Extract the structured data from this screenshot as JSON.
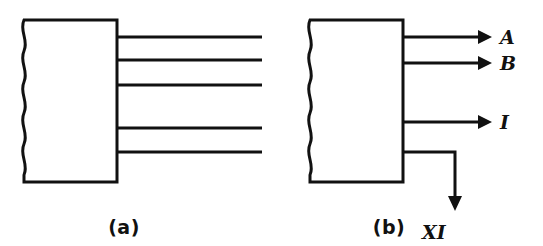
{
  "figure": {
    "background_color": "#ffffff",
    "line_color": "#111111",
    "panels": [
      {
        "id": "a",
        "caption": "(a)",
        "caption_x": 124,
        "caption_y": 234,
        "box": {
          "x": 22,
          "y": 20,
          "width": 95,
          "height": 162
        },
        "left_edge_style": "wavy-break",
        "lines": [
          {
            "name": "line-1",
            "y": 37,
            "x_start": 117,
            "x_end": 262,
            "arrow": false,
            "label": ""
          },
          {
            "name": "line-2",
            "y": 60,
            "x_start": 117,
            "x_end": 262,
            "arrow": false,
            "label": ""
          },
          {
            "name": "line-3",
            "y": 85,
            "x_start": 117,
            "x_end": 262,
            "arrow": false,
            "label": ""
          },
          {
            "name": "line-4",
            "y": 128,
            "x_start": 117,
            "x_end": 262,
            "arrow": false,
            "label": ""
          },
          {
            "name": "line-5",
            "y": 152,
            "x_start": 117,
            "x_end": 262,
            "arrow": false,
            "label": ""
          }
        ]
      },
      {
        "id": "b",
        "caption": "(b)",
        "caption_x": 389,
        "caption_y": 234,
        "box": {
          "x": 308,
          "y": 20,
          "width": 95,
          "height": 162
        },
        "left_edge_style": "wavy-break",
        "lines": [
          {
            "name": "line-a",
            "y": 37,
            "x_start": 403,
            "x_end": 487,
            "arrow": true,
            "label": "A",
            "label_x": 500,
            "label_y": 44
          },
          {
            "name": "line-b",
            "y": 63,
            "x_start": 403,
            "x_end": 487,
            "arrow": true,
            "label": "B",
            "label_x": 500,
            "label_y": 70
          },
          {
            "name": "line-i",
            "y": 122,
            "x_start": 403,
            "x_end": 487,
            "arrow": true,
            "label": "I",
            "label_x": 500,
            "label_y": 129
          }
        ],
        "bent_line": {
          "name": "line-xi",
          "y": 152,
          "x_start": 403,
          "corner_x": 455,
          "y_end": 208,
          "arrow": true,
          "arrow_direction": "down",
          "label": "XI",
          "label_x": 432,
          "label_y": 237
        }
      }
    ]
  }
}
